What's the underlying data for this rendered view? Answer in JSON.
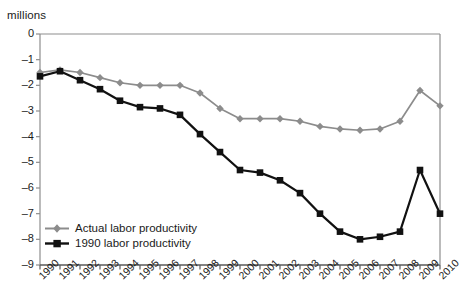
{
  "chart_data": {
    "type": "line",
    "title": "",
    "xlabel": "",
    "ylabel": "millions",
    "ylim": [
      -9,
      0
    ],
    "xlim": [
      1990,
      2010
    ],
    "grid": false,
    "legend_position": "bottom-left",
    "yticks": [
      "0",
      "–1",
      "–2",
      "–3",
      "–4",
      "–5",
      "–6",
      "–7",
      "–8",
      "–9"
    ],
    "ytick_values": [
      0,
      -1,
      -2,
      -3,
      -4,
      -5,
      -6,
      -7,
      -8,
      -9
    ],
    "categories": [
      "1990",
      "1991",
      "1992",
      "1993",
      "1994",
      "1995",
      "1996",
      "1997",
      "1998",
      "1999",
      "2000",
      "2001",
      "2002",
      "2003",
      "2004",
      "2005",
      "2006",
      "2007",
      "2008",
      "2009",
      "2010"
    ],
    "x": [
      1990,
      1991,
      1992,
      1993,
      1994,
      1995,
      1996,
      1997,
      1998,
      1999,
      2000,
      2001,
      2002,
      2003,
      2004,
      2005,
      2006,
      2007,
      2008,
      2009,
      2010
    ],
    "series": [
      {
        "name": "Actual labor productivity",
        "color": "#8c8c8c",
        "marker": "diamond",
        "values": [
          -1.5,
          -1.4,
          -1.5,
          -1.7,
          -1.9,
          -2.0,
          -2.0,
          -2.0,
          -2.3,
          -2.9,
          -3.3,
          -3.3,
          -3.3,
          -3.4,
          -3.6,
          -3.7,
          -3.75,
          -3.7,
          -3.4,
          -2.2,
          -2.8
        ]
      },
      {
        "name": "1990 labor productivity",
        "color": "#111111",
        "marker": "square",
        "values": [
          -1.65,
          -1.45,
          -1.8,
          -2.15,
          -2.6,
          -2.85,
          -2.9,
          -3.15,
          -3.9,
          -4.6,
          -5.3,
          -5.4,
          -5.7,
          -6.2,
          -7.0,
          -7.7,
          -8.0,
          -7.9,
          -7.7,
          -5.3,
          -7.0
        ]
      }
    ]
  },
  "axis": {
    "units_label": "millions"
  },
  "legend": {
    "items": [
      {
        "label": "Actual labor productivity"
      },
      {
        "label": "1990 labor productivity"
      }
    ]
  }
}
